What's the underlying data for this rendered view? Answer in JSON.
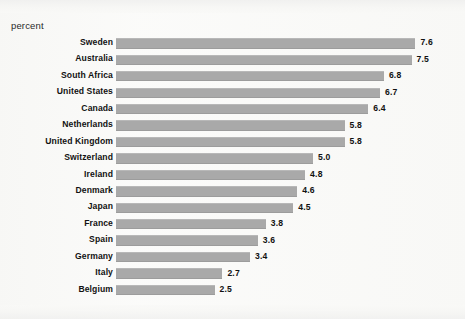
{
  "figure": {
    "unit_label": "percent",
    "background_color": "#f8f8f6",
    "bar_color": "#a9a9a9",
    "text_color": "#121212"
  },
  "chart_data": {
    "type": "bar",
    "orientation": "horizontal",
    "title": "",
    "subtitle": "",
    "xlabel": "percent",
    "ylabel": "",
    "grid": false,
    "legend": false,
    "xlim": [
      0,
      8
    ],
    "value_format": "one-decimal",
    "sorted": "descending",
    "categories": [
      "Sweden",
      "Australia",
      "South Africa",
      "United States",
      "Canada",
      "Netherlands",
      "United Kingdom",
      "Switzerland",
      "Ireland",
      "Denmark",
      "Japan",
      "France",
      "Spain",
      "Germany",
      "Italy",
      "Belgium"
    ],
    "values": [
      7.6,
      7.5,
      6.8,
      6.7,
      6.4,
      5.8,
      5.8,
      5.0,
      4.8,
      4.6,
      4.5,
      3.8,
      3.6,
      3.4,
      2.7,
      2.5
    ],
    "value_labels": [
      "7.6",
      "7.5",
      "6.8",
      "6.7",
      "6.4",
      "5.8",
      "5.8",
      "5.0",
      "4.8",
      "4.6",
      "4.5",
      "3.8",
      "3.6",
      "3.4",
      "2.7",
      "2.5"
    ]
  },
  "rows": [
    {
      "label": "Sweden",
      "value": 7.6,
      "value_label": "7.6"
    },
    {
      "label": "Australia",
      "value": 7.5,
      "value_label": "7.5"
    },
    {
      "label": "South Africa",
      "value": 6.8,
      "value_label": "6.8"
    },
    {
      "label": "United States",
      "value": 6.7,
      "value_label": "6.7"
    },
    {
      "label": "Canada",
      "value": 6.4,
      "value_label": "6.4"
    },
    {
      "label": "Netherlands",
      "value": 5.8,
      "value_label": "5.8"
    },
    {
      "label": "United Kingdom",
      "value": 5.8,
      "value_label": "5.8"
    },
    {
      "label": "Switzerland",
      "value": 5.0,
      "value_label": "5.0"
    },
    {
      "label": "Ireland",
      "value": 4.8,
      "value_label": "4.8"
    },
    {
      "label": "Denmark",
      "value": 4.6,
      "value_label": "4.6"
    },
    {
      "label": "Japan",
      "value": 4.5,
      "value_label": "4.5"
    },
    {
      "label": "France",
      "value": 3.8,
      "value_label": "3.8"
    },
    {
      "label": "Spain",
      "value": 3.6,
      "value_label": "3.6"
    },
    {
      "label": "Germany",
      "value": 3.4,
      "value_label": "3.4"
    },
    {
      "label": "Italy",
      "value": 2.7,
      "value_label": "2.7"
    },
    {
      "label": "Belgium",
      "value": 2.5,
      "value_label": "2.5"
    }
  ]
}
